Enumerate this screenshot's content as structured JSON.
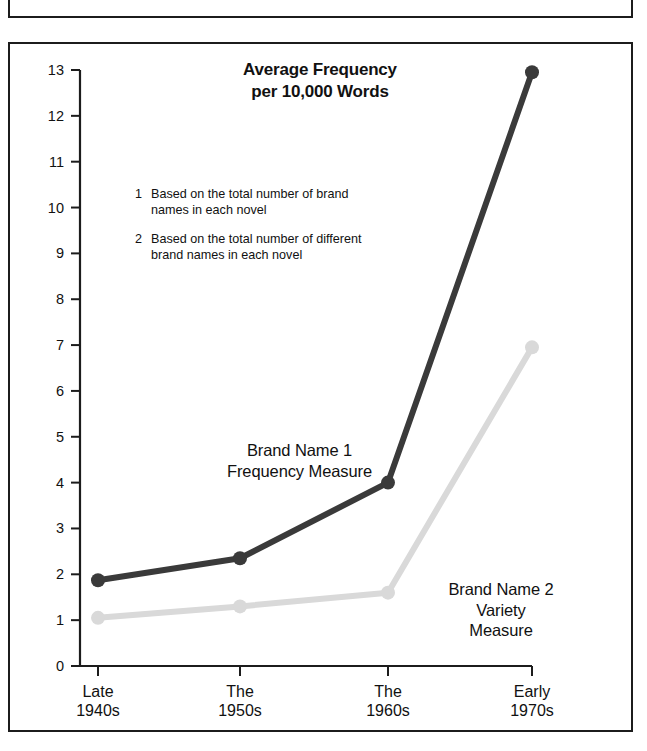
{
  "chart_data": {
    "type": "line",
    "title": "Average Frequency per 10,000 Words",
    "title_line1": "Average Frequency",
    "title_line2": "per 10,000 Words",
    "xlabel": "",
    "ylabel": "",
    "categories": [
      "Late 1940s",
      "The 1950s",
      "The 1960s",
      "Early 1970s"
    ],
    "category_lines": [
      {
        "line1": "Late",
        "line2": "1940s"
      },
      {
        "line1": "The",
        "line2": "1950s"
      },
      {
        "line1": "The",
        "line2": "1960s"
      },
      {
        "line1": "Early",
        "line2": "1970s"
      }
    ],
    "ylim": [
      0,
      13
    ],
    "ytick_labels": [
      "13",
      "12",
      "11",
      "10",
      "9",
      "8",
      "7",
      "6",
      "5",
      "4",
      "3",
      "2",
      "1",
      "0"
    ],
    "yticks": [
      13,
      12,
      11,
      10,
      9,
      8,
      7,
      6,
      5,
      4,
      3,
      2,
      1,
      0
    ],
    "grid": false,
    "legend": "inline-labels",
    "series": [
      {
        "name": "Brand Name 1 Frequency Measure",
        "label_line1": "Brand Name 1",
        "label_line2": "Frequency Measure",
        "color": "#3a3a3a",
        "values": [
          1.87,
          2.35,
          4.0,
          12.95
        ]
      },
      {
        "name": "Brand Name 2 Variety Measure",
        "label_line1": "Brand Name 2",
        "label_line2": "Variety",
        "label_line3": "Measure",
        "color": "#d9d9d9",
        "values": [
          1.05,
          1.3,
          1.6,
          6.95
        ]
      }
    ],
    "annotations": [
      {
        "num": "1",
        "text": "Based on the total number of brand names in each novel"
      },
      {
        "num": "2",
        "text": "Based on the total number of different brand names in each novel"
      }
    ]
  },
  "footnotes": [
    {
      "num": "1",
      "line1": "Based on the total number of brand",
      "line2": "names in each novel"
    },
    {
      "num": "2",
      "line1": "Based on the total number of different",
      "line2": "brand names in each novel"
    }
  ],
  "colors": {
    "series_dark": "#3a3a3a",
    "series_light": "#d9d9d9",
    "axis": "#1c1c1c",
    "frame": "#1c1c1c",
    "text": "#111111",
    "background": "#ffffff"
  }
}
